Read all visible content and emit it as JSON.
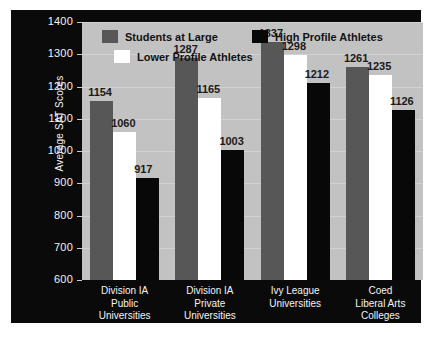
{
  "chart_data": {
    "type": "bar",
    "title": "",
    "xlabel": "",
    "ylabel": "Average SAT Scores",
    "ylim": [
      600,
      1400
    ],
    "ytick_step": 100,
    "grid": true,
    "legend_position": "top-left-inside",
    "categories": [
      "Division IA\nPublic\nUniversities",
      "Division IA\nPrivate\nUniversities",
      "Ivy League\nUniversities",
      "Coed\nLiberal Arts\nColleges"
    ],
    "category_lines": [
      [
        "Division IA",
        "Public",
        "Universities"
      ],
      [
        "Division IA",
        "Private",
        "Universities"
      ],
      [
        "Ivy League",
        "Universities"
      ],
      [
        "Coed",
        "Liberal Arts",
        "Colleges"
      ]
    ],
    "yticks": [
      1400,
      1300,
      1200,
      1100,
      1000,
      900,
      800,
      700,
      600
    ],
    "series": [
      {
        "name": "Students at Large",
        "color": "#575757",
        "values": [
          1154,
          1287,
          1337,
          1261
        ]
      },
      {
        "name": "Lower Profile Athletes",
        "color": "#ffffff",
        "values": [
          1060,
          1165,
          1298,
          1235
        ]
      },
      {
        "name": "High Profile Athletes",
        "color": "#080808",
        "values": [
          917,
          1003,
          1212,
          1126
        ]
      }
    ]
  },
  "legend": {
    "items": [
      {
        "label": "Students at Large",
        "swatch": "sw-large"
      },
      {
        "label": "High Profile Athletes",
        "swatch": "sw-high"
      },
      {
        "label": "Lower Profile Athletes",
        "swatch": "sw-lower"
      }
    ]
  },
  "colors": {
    "panel_background": "#0a0a0a",
    "plot_background": "#c2c2c2",
    "gridline": "#d2d2d2",
    "axis_text": "#f2f2f2",
    "value_text": "#1a1a1a"
  }
}
